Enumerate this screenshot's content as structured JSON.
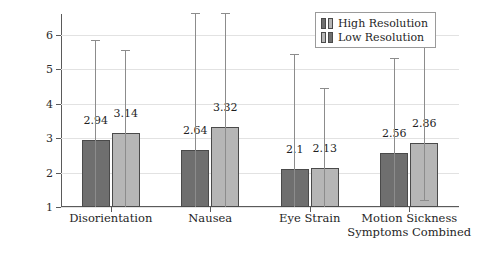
{
  "chart_data": {
    "type": "bar",
    "title": "",
    "xlabel": "",
    "ylabel": "Mean of All Symptoms Combined",
    "ylim": [
      1,
      6.6
    ],
    "yticks": [
      1,
      2,
      3,
      4,
      5,
      6
    ],
    "ytick_labels": [
      "1",
      "2",
      "3",
      "4",
      "5",
      "6"
    ],
    "grid": true,
    "legend_position": "top-right",
    "categories": [
      "Disorientation",
      "Nausea",
      "Eye Strain",
      "Motion Sickness Symptoms Combined"
    ],
    "series": [
      {
        "name": "High Resolution",
        "color": "#6f6f6f",
        "values": [
          2.94,
          2.64,
          2.1,
          2.56
        ],
        "value_labels": [
          "2.94",
          "2.64",
          "2.1",
          "2.56"
        ],
        "error_upper": [
          5.82,
          6.6,
          5.4,
          5.3
        ],
        "error_lower": [
          1.0,
          1.0,
          1.0,
          1.0
        ]
      },
      {
        "name": "Low Resolution",
        "color": "#b6b6b6",
        "values": [
          3.14,
          3.32,
          2.13,
          2.86
        ],
        "value_labels": [
          "3.14",
          "3.32",
          "2.13",
          "2.86"
        ],
        "error_upper": [
          5.52,
          6.6,
          4.42,
          5.74
        ],
        "error_lower": [
          1.0,
          1.0,
          1.0,
          1.18
        ]
      }
    ]
  },
  "legend": {
    "entries": [
      {
        "label": "High Resolution"
      },
      {
        "label": "Low Resolution"
      }
    ]
  },
  "axis": {
    "y_title": "Mean of All Symptoms Combined"
  },
  "group_labels": [
    {
      "line1": "Disorientation",
      "line2": ""
    },
    {
      "line1": "Nausea",
      "line2": ""
    },
    {
      "line1": "Eye Strain",
      "line2": ""
    },
    {
      "line1": "Motion Sickness",
      "line2": "Symptoms Combined"
    }
  ]
}
